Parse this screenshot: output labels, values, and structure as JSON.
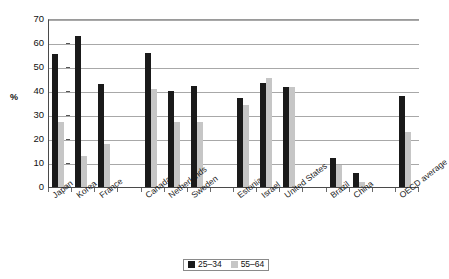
{
  "chart_data": {
    "type": "bar",
    "title": "",
    "subtitle": "",
    "xlabel": "",
    "ylabel": "%",
    "ylim": [
      0,
      70
    ],
    "ytick_step": 10,
    "yticks": [
      0,
      10,
      20,
      30,
      40,
      50,
      60,
      70
    ],
    "ytick_labels": [
      "0",
      "10",
      "20",
      "30",
      "40",
      "50",
      "60",
      "70"
    ],
    "grid": true,
    "grid_axis": "y",
    "legend_position": "bottom-center",
    "orientation": "vertical",
    "categories": [
      "Japan",
      "Korea",
      "France",
      "Canada",
      "Netherlands",
      "Sweden",
      "Estonia",
      "Israel",
      "United States",
      "Brazil",
      "China",
      "OECD average"
    ],
    "category_slots": [
      "Japan",
      "Korea",
      "France",
      "",
      "Canada",
      "Netherlands",
      "Sweden",
      "",
      "Estonia",
      "Israel",
      "United States",
      "",
      "Brazil",
      "China",
      "",
      "OECD average"
    ],
    "series": [
      {
        "name": "25–34",
        "color": "#1a1a1a",
        "values": [
          55.5,
          63.0,
          43.0,
          56.0,
          40.0,
          42.0,
          37.0,
          43.5,
          41.5,
          12.0,
          6.0,
          38.0
        ]
      },
      {
        "name": "55–64",
        "color": "#c6c6c6",
        "values": [
          27.0,
          13.0,
          18.0,
          41.0,
          27.0,
          27.0,
          34.0,
          45.5,
          41.5,
          9.0,
          2.0,
          23.0
        ]
      }
    ]
  },
  "legend": {
    "items": [
      {
        "label": "25–34",
        "swatch": "black-square-swatch"
      },
      {
        "label": "55–64",
        "swatch": "gray-square-swatch"
      }
    ]
  },
  "axis": {
    "y_title": "%"
  },
  "colors": {
    "series_a": "#1a1a1a",
    "series_b": "#c6c6c6",
    "gridline": "#a8a8a8",
    "axis": "#4a4a4a",
    "background": "#ffffff",
    "text": "#1a1a1a"
  }
}
